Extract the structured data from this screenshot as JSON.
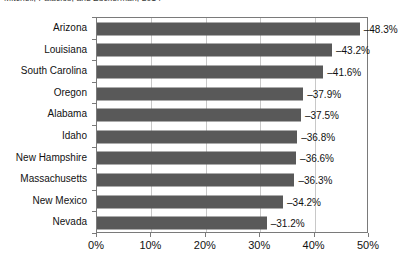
{
  "caption": {
    "text": "Mitchell, Palacios, and Zuckerman, 2014"
  },
  "chart_data": {
    "type": "bar",
    "orientation": "horizontal",
    "title": "",
    "subtitle": "",
    "xlabel": "",
    "ylabel": "",
    "categories": [
      "Arizona",
      "Louisiana",
      "South Carolina",
      "Oregon",
      "Alabama",
      "Idaho",
      "New Hampshire",
      "Massachusetts",
      "New Mexico",
      "Nevada"
    ],
    "values": [
      -48.3,
      -43.2,
      -41.6,
      -37.9,
      -37.5,
      -36.8,
      -36.6,
      -36.3,
      -34.2,
      -31.2
    ],
    "magnitudes": [
      48.3,
      43.2,
      41.6,
      37.9,
      37.5,
      36.8,
      36.6,
      36.3,
      34.2,
      31.2
    ],
    "data_labels": [
      "–48.3%",
      "–43.2%",
      "–41.6%",
      "–37.9%",
      "–37.5%",
      "–36.8%",
      "–36.6%",
      "–36.3%",
      "–34.2%",
      "–31.2%"
    ],
    "xticks": [
      0,
      10,
      20,
      30,
      40,
      50
    ],
    "xtick_labels": [
      "0%",
      "10%",
      "20%",
      "30%",
      "40%",
      "50%"
    ],
    "xlim": [
      0,
      50
    ],
    "grid": "vertical",
    "legend": "none",
    "bar_color": "#595959",
    "gridline_color": "#c8c8c8",
    "axis_color": "#7a7a7a",
    "text_color": "#111111"
  }
}
